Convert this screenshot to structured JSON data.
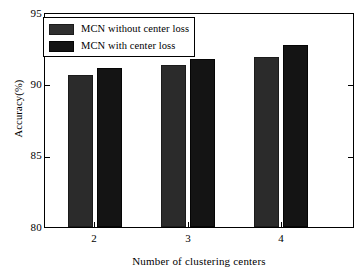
{
  "chart_data": {
    "type": "bar",
    "title": "",
    "subtitle": "",
    "xlabel": "Number of clustering centers",
    "ylabel": "Accuracy(%)",
    "categories": [
      "2",
      "3",
      "4"
    ],
    "ylim": [
      80,
      95
    ],
    "yticks": [
      "80",
      "85",
      "90",
      "95"
    ],
    "grid": false,
    "legend_position": "upper-left",
    "series": [
      {
        "name": "MCN without center loss",
        "color": "#2b2b2b",
        "values": [
          90.7,
          91.4,
          92.0
        ]
      },
      {
        "name": "MCN with center loss",
        "color": "#141414",
        "values": [
          91.2,
          91.8,
          92.8
        ]
      }
    ]
  },
  "legend": {
    "items": [
      {
        "label": "MCN without center loss"
      },
      {
        "label": "MCN with center loss"
      }
    ]
  },
  "axes": {
    "y_title": "Accuracy(%)",
    "x_title": "Number of clustering centers",
    "y_ticks": [
      "95",
      "90",
      "85",
      "80"
    ],
    "x_ticks": [
      "2",
      "3",
      "4"
    ]
  }
}
